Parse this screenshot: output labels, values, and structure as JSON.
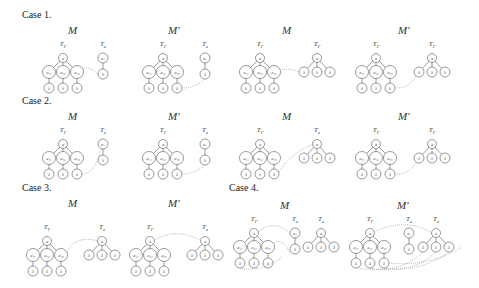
{
  "cases": [
    {
      "label": "Case 1.",
      "models": [
        "M",
        "M′",
        "M",
        "M′"
      ]
    },
    {
      "label": "Case 2.",
      "models": [
        "M",
        "M′",
        "M",
        "M′"
      ]
    },
    {
      "label": "Case 3.",
      "models": [
        "M",
        "M′"
      ]
    },
    {
      "label": "Case 4.",
      "models": [
        "M",
        "M′"
      ]
    }
  ],
  "tree_labels": {
    "t_gamma": "TΓ",
    "t_a": "Ta"
  },
  "node_labels": {
    "root": "a",
    "child1": "a₁₁",
    "child2": "a₁₂",
    "child3": "a₁₃",
    "single": "a₁",
    "leaf": "λ"
  },
  "colors": {
    "stroke": "#555555",
    "dotted": "#999999"
  }
}
